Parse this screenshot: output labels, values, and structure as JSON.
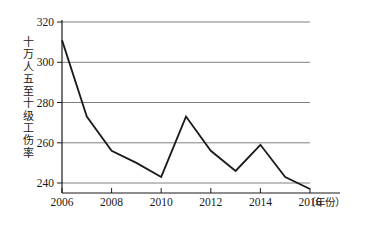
{
  "chart_data": {
    "type": "line",
    "title": "",
    "xlabel": "年份",
    "xlabel_display": "（年份）",
    "ylabel": "十万人五至十级工伤率",
    "x": [
      2006,
      2007,
      2008,
      2009,
      2010,
      2011,
      2012,
      2013,
      2014,
      2015,
      2016
    ],
    "values": [
      311,
      273,
      256,
      250,
      243,
      273,
      256,
      246,
      259,
      243,
      237
    ],
    "series": [
      {
        "name": "十万人五至十级工伤率",
        "values": [
          311,
          273,
          256,
          250,
          243,
          273,
          256,
          246,
          259,
          243,
          237
        ]
      }
    ],
    "xlim": [
      2006,
      2016
    ],
    "ylim": [
      232,
      320
    ],
    "y_ticks": [
      240,
      260,
      280,
      300,
      320
    ],
    "y_tick_labels": [
      "240",
      "260",
      "280",
      "300",
      "320"
    ],
    "x_ticks": [
      2006,
      2008,
      2010,
      2012,
      2014,
      2016
    ],
    "x_tick_labels": [
      "2006",
      "2008",
      "2010",
      "2012",
      "2014",
      "2016"
    ],
    "x_minor_ticks": [
      2007,
      2009,
      2011,
      2013,
      2015
    ],
    "grid": "horizontal",
    "legend": "none",
    "line_color": "#1a1a1a",
    "line_width": 1.8,
    "grid_color": "#808080",
    "axis_color": "#1a1a1a",
    "background": "#ffffff"
  },
  "axes": {
    "y_title": "十万人五至十级工伤率",
    "x_unit": "（年份）",
    "y_tick_0": "240",
    "y_tick_1": "260",
    "y_tick_2": "280",
    "y_tick_3": "300",
    "y_tick_4": "320",
    "x_tick_0": "2006",
    "x_tick_1": "2008",
    "x_tick_2": "2010",
    "x_tick_3": "2012",
    "x_tick_4": "2014",
    "x_tick_5": "2016"
  }
}
